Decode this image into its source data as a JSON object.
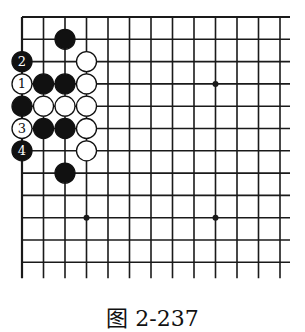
{
  "caption": "图 2-237",
  "board": {
    "cols": 13,
    "rows": 12,
    "origin_x": 22,
    "origin_y": 17,
    "step_x": 21.5,
    "step_y": 22.3,
    "line_color": "#1a1a1a",
    "hoshi": [
      [
        9,
        3
      ],
      [
        3,
        9
      ],
      [
        9,
        9
      ]
    ],
    "stones": [
      {
        "col": 2,
        "row": 1,
        "color": "black",
        "label": ""
      },
      {
        "col": 3,
        "row": 2,
        "color": "white",
        "label": ""
      },
      {
        "col": 0,
        "row": 2,
        "color": "black",
        "label": "2"
      },
      {
        "col": 0,
        "row": 3,
        "color": "white",
        "label": "1"
      },
      {
        "col": 1,
        "row": 3,
        "color": "black",
        "label": ""
      },
      {
        "col": 2,
        "row": 3,
        "color": "black",
        "label": ""
      },
      {
        "col": 3,
        "row": 3,
        "color": "white",
        "label": ""
      },
      {
        "col": 0,
        "row": 4,
        "color": "black",
        "label": ""
      },
      {
        "col": 1,
        "row": 4,
        "color": "white",
        "label": ""
      },
      {
        "col": 2,
        "row": 4,
        "color": "white",
        "label": ""
      },
      {
        "col": 3,
        "row": 4,
        "color": "white",
        "label": ""
      },
      {
        "col": 0,
        "row": 5,
        "color": "white",
        "label": "3"
      },
      {
        "col": 1,
        "row": 5,
        "color": "black",
        "label": ""
      },
      {
        "col": 2,
        "row": 5,
        "color": "black",
        "label": ""
      },
      {
        "col": 3,
        "row": 5,
        "color": "white",
        "label": ""
      },
      {
        "col": 0,
        "row": 6,
        "color": "black",
        "label": "4"
      },
      {
        "col": 3,
        "row": 6,
        "color": "white",
        "label": ""
      },
      {
        "col": 2,
        "row": 7,
        "color": "black",
        "label": ""
      }
    ]
  }
}
